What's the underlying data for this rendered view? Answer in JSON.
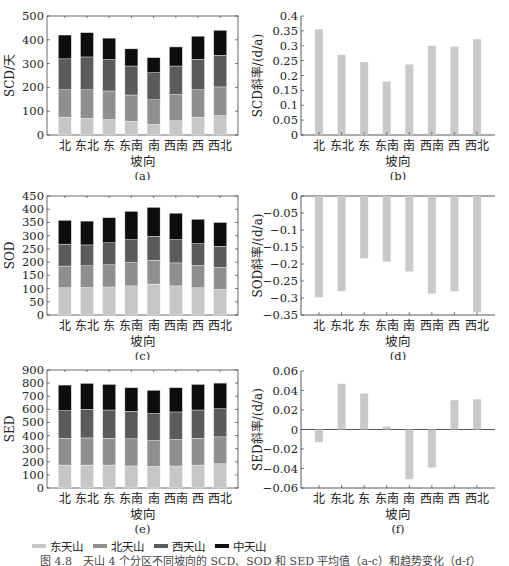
{
  "colors": {
    "east": "#c6c6c6",
    "north": "#8f8f8f",
    "west": "#5b5b5b",
    "central": "#0d0d0d",
    "trend_bar": "#c9c9c9",
    "axis": "#444444"
  },
  "legend": {
    "items": [
      {
        "label": "东天山",
        "color_key": "east"
      },
      {
        "label": "北天山",
        "color_key": "north"
      },
      {
        "label": "西天山",
        "color_key": "west"
      },
      {
        "label": "中天山",
        "color_key": "central"
      }
    ]
  },
  "caption": "图 4.8　天山 4 个分区不同坡向的 SCD、SOD 和 SED 平均值（a-c）和趋势变化（d-f）",
  "chart_data": [
    {
      "id": "a",
      "type": "bar",
      "stacked": true,
      "title": "(a)",
      "xlabel": "坡向",
      "ylabel": "SCD/天",
      "categories": [
        "北",
        "东北",
        "东",
        "东南",
        "南",
        "西南",
        "西",
        "西北"
      ],
      "ylim": [
        0,
        500
      ],
      "yticks": [
        0,
        100,
        200,
        300,
        400,
        500
      ],
      "frame": "box",
      "series": [
        {
          "name": "东天山",
          "values": [
            75,
            70,
            65,
            58,
            45,
            60,
            75,
            82
          ]
        },
        {
          "name": "北天山",
          "values": [
            115,
            120,
            120,
            110,
            103,
            110,
            115,
            120
          ]
        },
        {
          "name": "西天山",
          "values": [
            130,
            138,
            132,
            122,
            114,
            120,
            128,
            133
          ]
        },
        {
          "name": "中天山",
          "values": [
            100,
            102,
            90,
            72,
            63,
            80,
            97,
            105
          ]
        }
      ]
    },
    {
      "id": "b",
      "type": "bar",
      "title": "(b)",
      "xlabel": "坡向",
      "ylabel": "SCD斜率/(d/a)",
      "categories": [
        "北",
        "东北",
        "东",
        "东南",
        "南",
        "西南",
        "西",
        "西北"
      ],
      "ylim": [
        0,
        0.4
      ],
      "yticks": [
        0,
        0.05,
        0.1,
        0.15,
        0.2,
        0.25,
        0.3,
        0.35,
        0.4
      ],
      "ytick_labels": [
        "0",
        "0.05",
        "0.1",
        "0.15",
        "0.2",
        "0.25",
        "0.3",
        "0.35",
        "0.4"
      ],
      "frame": "axes",
      "values": [
        0.355,
        0.27,
        0.245,
        0.18,
        0.237,
        0.3,
        0.297,
        0.322
      ]
    },
    {
      "id": "c",
      "type": "bar",
      "stacked": true,
      "title": "(c)",
      "xlabel": "坡向",
      "ylabel": "SOD",
      "categories": [
        "北",
        "东北",
        "东",
        "东南",
        "南",
        "西南",
        "西",
        "西北"
      ],
      "ylim": [
        0,
        450
      ],
      "yticks": [
        0,
        50,
        100,
        150,
        200,
        250,
        300,
        350,
        400,
        450
      ],
      "frame": "box",
      "series": [
        {
          "name": "东天山",
          "values": [
            103,
            104,
            106,
            110,
            117,
            110,
            103,
            97
          ]
        },
        {
          "name": "北天山",
          "values": [
            82,
            82,
            84,
            88,
            90,
            87,
            84,
            83
          ]
        },
        {
          "name": "西天山",
          "values": [
            83,
            79,
            83,
            87,
            91,
            88,
            83,
            80
          ]
        },
        {
          "name": "中天山",
          "values": [
            90,
            90,
            95,
            107,
            109,
            100,
            92,
            90
          ]
        }
      ]
    },
    {
      "id": "d",
      "type": "bar",
      "title": "(d)",
      "xlabel": "坡向",
      "ylabel": "SOD斜率/(d/a)",
      "categories": [
        "北",
        "东北",
        "东",
        "东南",
        "南",
        "西南",
        "西",
        "西北"
      ],
      "ylim": [
        -0.35,
        0
      ],
      "yticks": [
        0,
        -0.05,
        -0.1,
        -0.15,
        -0.2,
        -0.25,
        -0.3,
        -0.35
      ],
      "ytick_labels": [
        "0",
        "−0.05",
        "−0.1",
        "−0.15",
        "−0.2",
        "−0.25",
        "−0.3",
        "−0.35"
      ],
      "frame": "axes",
      "values": [
        -0.298,
        -0.28,
        -0.183,
        -0.193,
        -0.222,
        -0.287,
        -0.28,
        -0.342
      ]
    },
    {
      "id": "e",
      "type": "bar",
      "stacked": true,
      "title": "(e)",
      "xlabel": "坡向",
      "ylabel": "SED",
      "categories": [
        "北",
        "东北",
        "东",
        "东南",
        "南",
        "西南",
        "西",
        "西北"
      ],
      "ylim": [
        0,
        900
      ],
      "yticks": [
        0,
        100,
        200,
        300,
        400,
        500,
        600,
        700,
        800,
        900
      ],
      "frame": "box",
      "series": [
        {
          "name": "东天山",
          "values": [
            175,
            175,
            175,
            168,
            165,
            168,
            175,
            185
          ]
        },
        {
          "name": "北天山",
          "values": [
            205,
            207,
            205,
            207,
            197,
            202,
            205,
            205
          ]
        },
        {
          "name": "西天山",
          "values": [
            210,
            218,
            215,
            210,
            206,
            210,
            215,
            215
          ]
        },
        {
          "name": "中天山",
          "values": [
            195,
            198,
            195,
            180,
            177,
            185,
            195,
            195
          ]
        }
      ]
    },
    {
      "id": "f",
      "type": "bar",
      "title": "(f)",
      "xlabel": "坡向",
      "ylabel": "SED斜率/(d/a)",
      "categories": [
        "北",
        "东北",
        "东",
        "东南",
        "南",
        "西南",
        "西",
        "西北"
      ],
      "ylim": [
        -0.06,
        0.06
      ],
      "yticks": [
        0.06,
        0.04,
        0.02,
        0,
        -0.02,
        -0.04,
        -0.06
      ],
      "ytick_labels": [
        "0.06",
        "0.04",
        "0.02",
        "0",
        "−0.02",
        "−0.04",
        "−0.06"
      ],
      "frame": "axes",
      "values": [
        -0.013,
        0.047,
        0.037,
        0.003,
        -0.051,
        -0.039,
        0.03,
        0.031
      ]
    }
  ]
}
